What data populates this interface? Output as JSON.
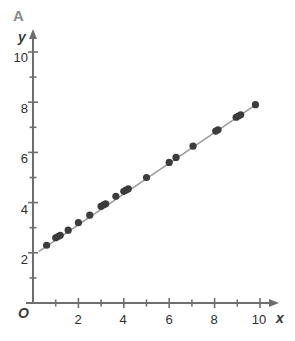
{
  "panel": {
    "letter": "A"
  },
  "axes": {
    "origin_label": "O",
    "x_axis_label": "x",
    "y_axis_label": "y",
    "x_tick_labels": [
      "2",
      "4",
      "6",
      "8",
      "10"
    ],
    "y_tick_labels": [
      "2",
      "4",
      "6",
      "8",
      "10"
    ]
  },
  "colors": {
    "point": "#3c3c3c",
    "line": "#9a9a9a",
    "axis": "#6e6e6e",
    "text": "#2e2e2e",
    "panel_letter": "#8a8a8a",
    "background": "#ffffff"
  },
  "chart_data": {
    "type": "scatter",
    "title": "A",
    "xlabel": "x",
    "ylabel": "y",
    "xlim": [
      0,
      10.8
    ],
    "ylim": [
      0,
      11.0
    ],
    "xticks": [
      2,
      4,
      6,
      8,
      10
    ],
    "yticks": [
      2,
      4,
      6,
      8,
      10
    ],
    "minor_tick_step": 1,
    "grid": false,
    "legend": null,
    "series": [
      {
        "name": "observations",
        "marker": "filled-circle",
        "color": "#3c3c3c",
        "points": [
          {
            "x": 0.6,
            "y": 2.3
          },
          {
            "x": 1.0,
            "y": 2.6
          },
          {
            "x": 1.1,
            "y": 2.65
          },
          {
            "x": 1.2,
            "y": 2.7
          },
          {
            "x": 1.55,
            "y": 2.9
          },
          {
            "x": 2.0,
            "y": 3.2
          },
          {
            "x": 2.5,
            "y": 3.5
          },
          {
            "x": 3.0,
            "y": 3.85
          },
          {
            "x": 3.1,
            "y": 3.9
          },
          {
            "x": 3.2,
            "y": 3.95
          },
          {
            "x": 3.65,
            "y": 4.25
          },
          {
            "x": 4.0,
            "y": 4.45
          },
          {
            "x": 4.1,
            "y": 4.5
          },
          {
            "x": 4.2,
            "y": 4.55
          },
          {
            "x": 5.0,
            "y": 5.0
          },
          {
            "x": 6.0,
            "y": 5.6
          },
          {
            "x": 6.3,
            "y": 5.8
          },
          {
            "x": 7.05,
            "y": 6.25
          },
          {
            "x": 8.05,
            "y": 6.85
          },
          {
            "x": 8.15,
            "y": 6.9
          },
          {
            "x": 8.95,
            "y": 7.4
          },
          {
            "x": 9.05,
            "y": 7.45
          },
          {
            "x": 9.15,
            "y": 7.5
          },
          {
            "x": 9.8,
            "y": 7.9
          }
        ]
      }
    ],
    "trend_line": {
      "type": "line",
      "color": "#9a9a9a",
      "x_start": 0.25,
      "y_start": 2.05,
      "x_end": 9.85,
      "y_end": 7.92,
      "approx_slope": 0.61,
      "approx_intercept": 1.9
    }
  }
}
